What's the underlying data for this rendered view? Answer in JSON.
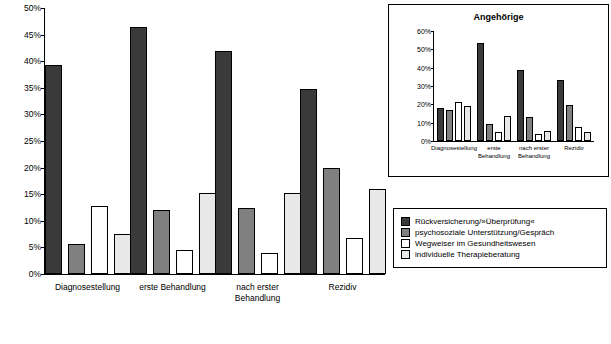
{
  "chart_data": [
    {
      "type": "bar",
      "id": "main",
      "title": "",
      "categories": [
        "Diagnosestellung",
        "erste Behandlung",
        "nach erster Behandlung",
        "Rezidiv"
      ],
      "series": [
        {
          "name": "Rückversicherung/»Überprüfung«",
          "color": "#3a3a3a",
          "values": [
            39.2,
            46.5,
            42.0,
            34.8
          ]
        },
        {
          "name": "psychosoziale Unterstützung/Gespräch",
          "color": "#808080",
          "values": [
            5.7,
            12.0,
            12.4,
            19.9
          ]
        },
        {
          "name": "Wegweiser im Gesundheitswesen",
          "color": "#ffffff",
          "values": [
            12.8,
            4.5,
            4.0,
            6.8
          ]
        },
        {
          "name": "individuelle Therapieberatung",
          "color": "#e8e8e8",
          "values": [
            7.5,
            15.3,
            15.3,
            16.0
          ]
        }
      ],
      "ylabel": "",
      "xlabel": "",
      "ylim": [
        0,
        50
      ],
      "yticks": [
        "0%",
        "5%",
        "10%",
        "15%",
        "20%",
        "25%",
        "30%",
        "35%",
        "40%",
        "45%",
        "50%"
      ],
      "grid": false,
      "legend_position": "right-bottom"
    },
    {
      "type": "bar",
      "id": "inset",
      "title": "Angehörige",
      "categories": [
        "Diagnosestellung",
        "erste Behandlung",
        "nach erster Behandlung",
        "Rezidiv"
      ],
      "series": [
        {
          "name": "Rückversicherung/»Überprüfung«",
          "color": "#3a3a3a",
          "values": [
            18.0,
            53.5,
            38.5,
            33.5
          ]
        },
        {
          "name": "psychosoziale Unterstützung/Gespräch",
          "color": "#808080",
          "values": [
            17.0,
            9.5,
            13.0,
            19.5
          ]
        },
        {
          "name": "Wegweiser im Gesundheitswesen",
          "color": "#ffffff",
          "values": [
            21.5,
            5.0,
            4.0,
            7.5
          ]
        },
        {
          "name": "individuelle Therapieberatung",
          "color": "#e8e8e8",
          "values": [
            19.0,
            13.5,
            5.5,
            5.0
          ]
        }
      ],
      "ylim": [
        0,
        60
      ],
      "yticks": [
        "0%",
        "10%",
        "20%",
        "30%",
        "40%",
        "50%",
        "60%"
      ],
      "grid": false
    }
  ],
  "legend": {
    "items": [
      {
        "label": "Rückversicherung/»Überprüfung«",
        "color": "#3a3a3a"
      },
      {
        "label": "psychosoziale Unterstützung/Gespräch",
        "color": "#808080"
      },
      {
        "label": "Wegweiser im Gesundheitswesen",
        "color": "#ffffff"
      },
      {
        "label": "individuelle Therapieberatung",
        "color": "#e8e8e8"
      }
    ]
  },
  "inset": {
    "title": "Angehörige"
  }
}
